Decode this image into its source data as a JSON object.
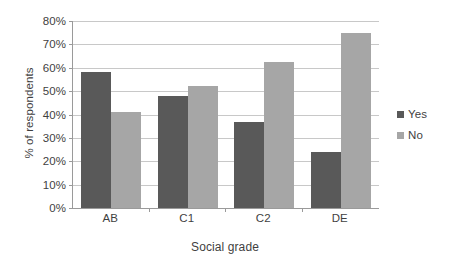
{
  "chart_data": {
    "type": "bar",
    "title": "",
    "subtitle": "",
    "xlabel": "Social grade",
    "ylabel": "% of respondents",
    "categories": [
      "AB",
      "C1",
      "C2",
      "DE"
    ],
    "series": [
      {
        "name": "Yes",
        "color": "#595959",
        "values": [
          58,
          48,
          37,
          24
        ]
      },
      {
        "name": "No",
        "color": "#a6a6a6",
        "values": [
          41,
          52,
          62.5,
          75
        ]
      }
    ],
    "ylim": [
      0,
      80
    ],
    "ytick_step": 10,
    "ytick_labels": [
      "80%",
      "70%",
      "60%",
      "50%",
      "40%",
      "30%",
      "20%",
      "10%",
      "0%"
    ],
    "ytick_values": [
      80,
      70,
      60,
      50,
      40,
      30,
      20,
      10,
      0
    ],
    "grid": "horizontal",
    "legend_position": "right",
    "value_suffix": "%"
  },
  "legend": {
    "items": [
      {
        "label": "Yes",
        "color": "#595959"
      },
      {
        "label": "No",
        "color": "#a6a6a6"
      }
    ]
  },
  "colors": {
    "series_yes": "#595959",
    "series_no": "#a6a6a6",
    "gridline": "#c8c8c8",
    "axis": "#9a9a9a",
    "text": "#3f3f3f",
    "background": "#ffffff"
  }
}
